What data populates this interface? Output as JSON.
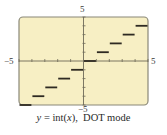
{
  "chart_data": {
    "type": "line",
    "subtype": "step-dot-mode",
    "title": "",
    "caption": {
      "lhs_var": "y",
      "equals": " = int(",
      "arg_var": "x",
      "close": "),",
      "mode": "DOT mode"
    },
    "xlabel": "",
    "ylabel": "",
    "xlim": [
      -5,
      5
    ],
    "ylim": [
      -5,
      5
    ],
    "xtick_step": 1,
    "ytick_step": 1,
    "tick_labels": {
      "x_min": "−5",
      "x_max": "5",
      "y_min": "−5",
      "y_max": "5"
    },
    "grid": false,
    "legend": null,
    "series": [
      {
        "name": "y = int(x)",
        "segments": [
          {
            "x_start": -5,
            "x_end": -4,
            "y": -5
          },
          {
            "x_start": -4,
            "x_end": -3,
            "y": -4
          },
          {
            "x_start": -3,
            "x_end": -2,
            "y": -3
          },
          {
            "x_start": -2,
            "x_end": -1,
            "y": -2
          },
          {
            "x_start": -1,
            "x_end": 0,
            "y": -1
          },
          {
            "x_start": 0,
            "x_end": 1,
            "y": 0
          },
          {
            "x_start": 1,
            "x_end": 2,
            "y": 1
          },
          {
            "x_start": 2,
            "x_end": 3,
            "y": 2
          },
          {
            "x_start": 3,
            "x_end": 4,
            "y": 3
          },
          {
            "x_start": 4,
            "x_end": 5,
            "y": 4
          }
        ]
      }
    ],
    "colors": {
      "screen_background": "#f7efc4",
      "frame": "#8a8878",
      "axes": "#6e6a58",
      "steps": "#2e2a22"
    }
  }
}
